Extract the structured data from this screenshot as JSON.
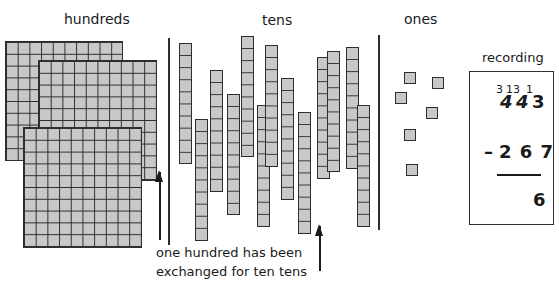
{
  "headings": {
    "hundreds": "hundreds",
    "tens": "tens",
    "ones": "ones",
    "recording": "recording"
  },
  "hundreds_flats": [
    {
      "x": 5,
      "y": 41,
      "w": 118,
      "h": 120
    },
    {
      "x": 38,
      "y": 60,
      "w": 119,
      "h": 121
    },
    {
      "x": 23,
      "y": 127,
      "w": 119,
      "h": 121
    }
  ],
  "tens_rods": [
    {
      "x": 179,
      "top": 43,
      "bottom": 164
    },
    {
      "x": 195,
      "top": 119,
      "bottom": 241
    },
    {
      "x": 210,
      "top": 70,
      "bottom": 192
    },
    {
      "x": 227,
      "top": 94,
      "bottom": 215
    },
    {
      "x": 241,
      "top": 36,
      "bottom": 157
    },
    {
      "x": 257,
      "top": 105,
      "bottom": 227
    },
    {
      "x": 265,
      "top": 45,
      "bottom": 167
    },
    {
      "x": 281,
      "top": 78,
      "bottom": 200
    },
    {
      "x": 298,
      "top": 112,
      "bottom": 234
    },
    {
      "x": 317,
      "top": 57,
      "bottom": 179
    },
    {
      "x": 327,
      "top": 51,
      "bottom": 172
    },
    {
      "x": 346,
      "top": 47,
      "bottom": 169
    },
    {
      "x": 357,
      "top": 105,
      "bottom": 227
    }
  ],
  "ones_cubes": [
    {
      "x": 404,
      "y": 72
    },
    {
      "x": 432,
      "y": 77
    },
    {
      "x": 395,
      "y": 92
    },
    {
      "x": 426,
      "y": 107
    },
    {
      "x": 404,
      "y": 129
    },
    {
      "x": 406,
      "y": 164
    }
  ],
  "recording": {
    "exchanges": "3 13 1",
    "exchange_hundreds": "3",
    "exchange_tens": "13",
    "exchange_ones": "1",
    "top_number": "443",
    "top_hundreds": "4",
    "top_tens": "4",
    "top_ones": "3",
    "subtract_sign": "–",
    "subtrahend": "2 6 7",
    "result": "6"
  },
  "caption": {
    "line1": "one hundred has been",
    "line2": "exchanged for ten tens"
  }
}
